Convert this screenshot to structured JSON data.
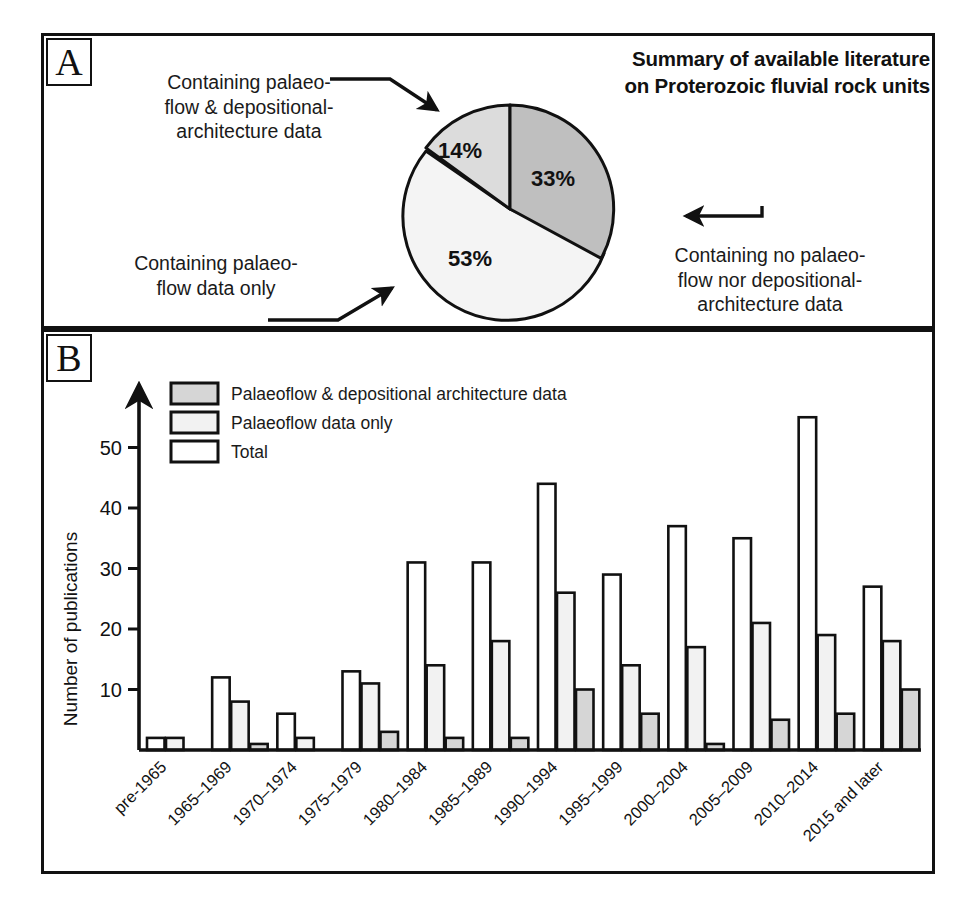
{
  "figure": {
    "panels": [
      {
        "tag": "A"
      },
      {
        "tag": "B"
      }
    ]
  },
  "panel_a": {
    "tag": "A",
    "title_line1": "Summary of available literature",
    "title_line2": "on Proterozoic fluvial rock units",
    "callouts": {
      "both": "Containing palaeo-\nflow & depositional-\narchitecture data",
      "flow_only": "Containing palaeo-\nflow data only",
      "none": "Containing no palaeo-\nflow nor depositional-\narchitecture data"
    },
    "slice_labels": [
      "14%",
      "33%",
      "53%"
    ]
  },
  "panel_b": {
    "tag": "B",
    "legend": [
      {
        "label": "Palaeoflow & depositional architecture data",
        "fill": "#d6d6d6"
      },
      {
        "label": "Palaeoflow data only",
        "fill": "#f2f2f2"
      },
      {
        "label": "Total",
        "fill": "#ffffff"
      }
    ]
  },
  "chart_data": [
    {
      "type": "pie",
      "title": "Summary of available literature on Proterozoic fluvial rock units",
      "labels": [
        "Containing no palaeo-flow nor depositional-architecture data",
        "Containing palaeo-flow & depositional-architecture data",
        "Containing palaeo-flow data only"
      ],
      "values": [
        33,
        14,
        53
      ],
      "value_labels": [
        "33%",
        "14%",
        "53%"
      ],
      "colors": [
        "#bfbfbf",
        "#dcdcdc",
        "#f4f4f4"
      ],
      "legend": "callout-arrows",
      "grid": false
    },
    {
      "type": "bar",
      "title": "",
      "xlabel": "",
      "ylabel": "Number of publications",
      "ylim": [
        0,
        58
      ],
      "yticks": [
        10,
        20,
        30,
        40,
        50
      ],
      "grid": false,
      "legend": "upper-left-inside",
      "categories": [
        "pre-1965",
        "1965–1969",
        "1970–1974",
        "1975–1979",
        "1980–1984",
        "1985–1989",
        "1990–1994",
        "1995–1999",
        "2000–2004",
        "2005–2009",
        "2010–2014",
        "2015 and later"
      ],
      "series": [
        {
          "name": "Total",
          "fill": "#ffffff",
          "values": [
            2,
            12,
            6,
            13,
            31,
            31,
            44,
            29,
            37,
            35,
            55,
            27
          ]
        },
        {
          "name": "Palaeoflow data only",
          "fill": "#f2f2f2",
          "values": [
            2,
            8,
            2,
            11,
            14,
            18,
            26,
            14,
            17,
            21,
            19,
            18
          ]
        },
        {
          "name": "Palaeoflow & depositional architecture data",
          "fill": "#d6d6d6",
          "values": [
            0,
            1,
            0,
            3,
            2,
            2,
            10,
            6,
            1,
            5,
            6,
            10
          ]
        }
      ]
    }
  ]
}
